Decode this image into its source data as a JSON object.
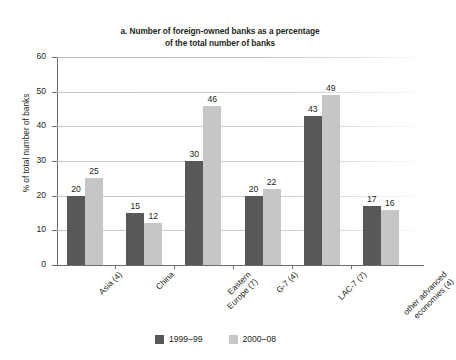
{
  "chart_data": {
    "type": "bar",
    "title": "a. Number of foreign-owned banks as a percentage of the total number of banks",
    "title_lines": [
      "a. Number of foreign-owned banks as a percentage",
      "of the total number of banks"
    ],
    "xlabel": "",
    "ylabel": "% of total number of banks",
    "ylim": [
      0,
      60
    ],
    "yticks": [
      0,
      10,
      20,
      30,
      40,
      50,
      60
    ],
    "ytick_labels": [
      "0",
      "10",
      "20",
      "30",
      "40",
      "50",
      "60"
    ],
    "grid": "horizontal",
    "legend_position": "bottom-center",
    "categories": [
      "Asia (4)",
      "China",
      "Eastern Europe (7)",
      "G-7 (4)",
      "LAC-7 (7)",
      "other advanced economies (4)"
    ],
    "category_label_lines": [
      [
        "Asia (4)"
      ],
      [
        "China"
      ],
      [
        "Eastern",
        "Europe (7)"
      ],
      [
        "G-7 (4)"
      ],
      [
        "LAC-7 (7)"
      ],
      [
        "other advanced",
        "economies (4)"
      ]
    ],
    "series": [
      {
        "name": "1999–99",
        "color": "#58585a",
        "values": [
          20,
          15,
          30,
          20,
          43,
          17
        ]
      },
      {
        "name": "2000–08",
        "color": "#c5c6c6",
        "values": [
          25,
          12,
          46,
          22,
          49,
          16
        ]
      }
    ]
  },
  "legend": {
    "items": [
      {
        "label": "1999–99",
        "color": "#58585a"
      },
      {
        "label": "2000–08",
        "color": "#c5c6c6"
      }
    ]
  },
  "colors": {
    "series_dark": "#58585a",
    "series_light": "#c5c6c6",
    "axis": "#6d6d6d",
    "gridline": "#c9c9c9",
    "text": "#231f20",
    "background": "#ffffff"
  }
}
